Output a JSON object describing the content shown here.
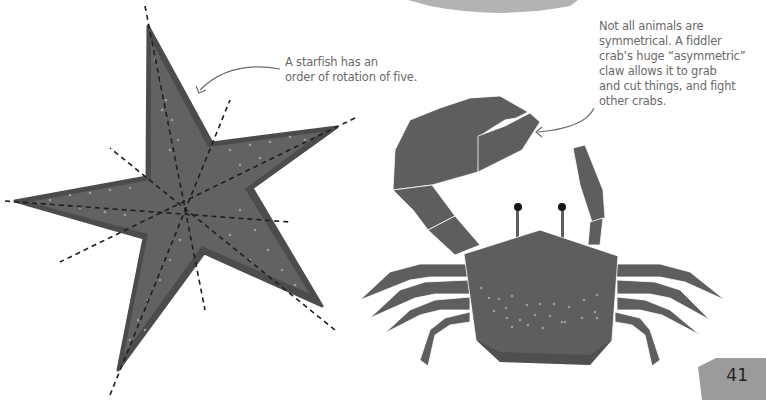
{
  "page": {
    "number": "41",
    "colors": {
      "background": "#ffffff",
      "body_fill": "#5e5e5e",
      "body_shadow": "#4a4a4a",
      "dots": "#9a9a9a",
      "caption_text": "#6a6a6a",
      "page_tab": "#9b9b9b",
      "top_banner": "#b0b0b0"
    }
  },
  "starfish": {
    "caption": "A starfish has an order of rotation of five.",
    "caption_lines": [
      "A starfish has an",
      "order of rotation of five."
    ],
    "illustration": "starfish-with-symmetry-lines",
    "symmetry_lines": 5
  },
  "crab": {
    "caption_lines": [
      "Not all animals are",
      "symmetrical. A fiddler",
      "crab’s huge “asymmetric”",
      "claw allows it to grab",
      "and cut things, and fight",
      "other crabs."
    ],
    "illustration": "fiddler-crab"
  }
}
